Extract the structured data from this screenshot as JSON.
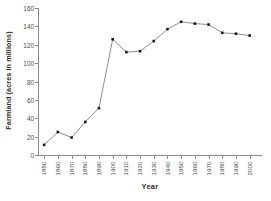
{
  "chart_data": {
    "type": "line",
    "title": "",
    "xlabel": "Year",
    "ylabel": "Farmland (acres in millions)",
    "categories": [
      "1850",
      "1860",
      "1870",
      "1880",
      "1890",
      "1900",
      "1910",
      "1920",
      "1930",
      "1940",
      "1950",
      "1960",
      "1970",
      "1980",
      "1990",
      "2000"
    ],
    "values": [
      11,
      25,
      19,
      36,
      51,
      126,
      112,
      113,
      124,
      137,
      145,
      143,
      142,
      133,
      132,
      130
    ],
    "x": [
      1850,
      1860,
      1870,
      1880,
      1890,
      1900,
      1910,
      1920,
      1930,
      1940,
      1950,
      1960,
      1970,
      1980,
      1990,
      2000
    ],
    "ylim": [
      0,
      160
    ],
    "ytick_labels": [
      "0",
      "20",
      "40",
      "60",
      "80",
      "100",
      "120",
      "140",
      "160"
    ],
    "ytick_values": [
      0,
      20,
      40,
      60,
      80,
      100,
      120,
      140,
      160
    ],
    "grid": false,
    "legend": null,
    "legend_position": "none",
    "marker": "square",
    "marker_color": "#1a1a1a",
    "line_color": "#5a5a5a",
    "axis_color": "#8c8c8c",
    "background": "#ffffff"
  },
  "caption": {
    "text": ""
  }
}
